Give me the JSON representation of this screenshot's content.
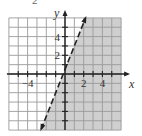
{
  "problem_label": "2",
  "colors": {
    "background": "#ffffff",
    "grid": "#9a9a9a",
    "shade": "#cfcfcf",
    "axis": "#222222",
    "boundary": "#222222"
  },
  "chart_data": {
    "type": "line",
    "title": "",
    "xlabel": "x",
    "ylabel": "y",
    "xlim": [
      -6,
      6
    ],
    "ylim": [
      -6,
      6
    ],
    "grid": true,
    "grid_step": 1,
    "x_tick_marks": [
      -5,
      -4,
      -3,
      -2,
      -1,
      1,
      2,
      3,
      4,
      5
    ],
    "y_tick_marks": [
      -5,
      -4,
      -3,
      -2,
      -1,
      1,
      2,
      3,
      4,
      5
    ],
    "x_tick_labels": [
      {
        "value": -4,
        "text": "−4"
      },
      {
        "value": 2,
        "text": "2"
      },
      {
        "value": 4,
        "text": "4"
      }
    ],
    "y_tick_labels": [
      {
        "value": 2,
        "text": "2"
      },
      {
        "value": 4,
        "text": "4"
      }
    ],
    "series": [
      {
        "name": "boundary",
        "style": "dashed",
        "equation": "y = 2.5x + 0.5",
        "slope": 2.5,
        "intercept": 0.5,
        "x": [
          -2.55,
          2.2
        ],
        "y": [
          -5.9,
          6.0
        ],
        "arrows": "both"
      }
    ],
    "shaded_region": {
      "inequality": "y < 2.5x + 0.5",
      "side": "right/below the line"
    }
  }
}
